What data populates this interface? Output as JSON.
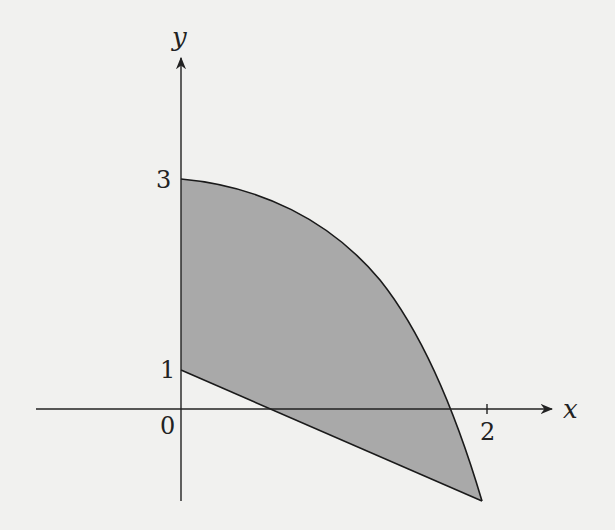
{
  "figure": {
    "axes": {
      "x_label": "x",
      "y_label": "y",
      "origin_label": "0",
      "x_ticks": [
        {
          "value": 2,
          "label": "2"
        }
      ],
      "y_ticks": [
        {
          "value": 1,
          "label": "1"
        },
        {
          "value": 3,
          "label": "3"
        }
      ]
    },
    "region": {
      "fill_color": "#a9a9a9",
      "stroke_color": "#1a1a1a",
      "upper_boundary": "curve from (0,3) decreasing concave-down to (2,-1)",
      "lower_boundary": "line from (0,1) to (2,-1)"
    },
    "colors": {
      "background": "#f1f1ef",
      "axis": "#222222"
    }
  }
}
